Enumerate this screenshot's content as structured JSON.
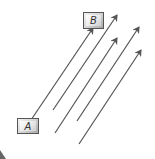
{
  "diagram": {
    "boxes": [
      {
        "id": "A",
        "label": "A",
        "x": 17,
        "y": 118,
        "w": 22,
        "h": 16
      },
      {
        "id": "B",
        "label": "B",
        "x": 83,
        "y": 12,
        "w": 21,
        "h": 17
      }
    ],
    "arrows": [
      {
        "from": [
          31,
          120
        ],
        "to": [
          93,
          28
        ]
      },
      {
        "from": [
          53,
          110
        ],
        "to": [
          117,
          15
        ]
      },
      {
        "from": [
          55,
          133
        ],
        "to": [
          117,
          38
        ]
      },
      {
        "from": [
          77,
          121
        ],
        "to": [
          139,
          27
        ]
      },
      {
        "from": [
          79,
          144
        ],
        "to": [
          141,
          50
        ]
      }
    ],
    "colors": {
      "arrow": "#555555",
      "box_border": "#555555"
    }
  }
}
